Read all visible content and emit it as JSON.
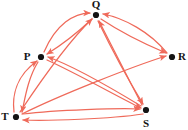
{
  "diagram": {
    "type": "directed-graph",
    "background_color": "#ffffff",
    "edge_color": "#ef6a5a",
    "node_color": "#141414",
    "label_color": "#141414",
    "nodes": [
      {
        "id": "P",
        "label": "P",
        "x": 41,
        "y": 57,
        "label_x": 27,
        "label_y": 57,
        "label_anchor": "middle"
      },
      {
        "id": "Q",
        "label": "Q",
        "x": 96,
        "y": 15,
        "label_x": 96,
        "label_y": 5,
        "label_anchor": "middle"
      },
      {
        "id": "R",
        "label": "R",
        "x": 172,
        "y": 57,
        "label_x": 182,
        "label_y": 57,
        "label_anchor": "middle"
      },
      {
        "id": "S",
        "label": "S",
        "x": 146,
        "y": 110,
        "label_x": 146,
        "label_y": 124,
        "label_anchor": "middle"
      },
      {
        "id": "T",
        "label": "T",
        "x": 16,
        "y": 117,
        "label_x": 5,
        "label_y": 117,
        "label_anchor": "middle"
      }
    ],
    "edges": [
      {
        "from": "P",
        "to": "Q",
        "style": "curved",
        "path": "M 44 52 C 56 24, 74 13, 90 13"
      },
      {
        "from": "Q",
        "to": "P",
        "style": "curved",
        "path": "M 92 19 C 76 34, 60 46, 47 54"
      },
      {
        "from": "R",
        "to": "Q",
        "style": "curved",
        "path": "M 167 53 C 150 32, 124 18, 103 14"
      },
      {
        "from": "Q",
        "to": "R",
        "style": "curved",
        "path": "M 101 19 C 122 33, 147 45, 166 53"
      },
      {
        "from": "T",
        "to": "Q",
        "style": "straight",
        "path": "M 20 112 C 44 76, 72 38, 92 19"
      },
      {
        "from": "S",
        "to": "Q",
        "style": "straight",
        "path": "M 142 105 C 126 74, 108 38, 99 21"
      },
      {
        "from": "Q",
        "to": "S",
        "style": "straight",
        "path": "M 98 21 C 112 50, 132 86, 143 104"
      },
      {
        "from": "P",
        "to": "T",
        "style": "curved",
        "path": "M 38 62 C 28 78, 25 98, 22 112"
      },
      {
        "from": "T",
        "to": "P",
        "style": "curved",
        "path": "M 14 112 C 12 96, 16 76, 37 61"
      },
      {
        "from": "S",
        "to": "P",
        "style": "straight",
        "path": "M 141 106 C 108 86, 68 64, 48 57"
      },
      {
        "from": "T",
        "to": "R",
        "style": "straight",
        "path": "M 22 114 C 60 95, 134 66, 166 56"
      },
      {
        "from": "P",
        "to": "S",
        "style": "straight",
        "path": "M 47 60 C 78 74, 120 98, 141 108"
      },
      {
        "from": "T",
        "to": "S",
        "style": "straight",
        "path": "M 23 114 C 56 110, 118 108, 140 109"
      },
      {
        "from": "S",
        "to": "T",
        "style": "straight",
        "path": "M 143 114 C 110 119, 48 121, 23 120"
      }
    ]
  }
}
